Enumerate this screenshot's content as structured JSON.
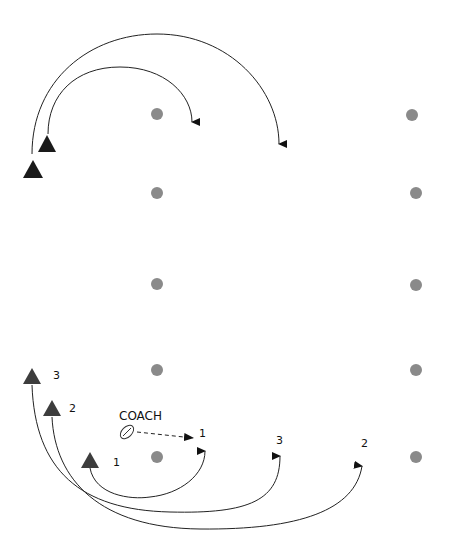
{
  "diagram": {
    "coach_label": "COACH",
    "colors": {
      "cone": "#8a8a8a",
      "player_top": "#1a1a1a",
      "player_bottom": "#3d3d3d",
      "arrow": "#222222"
    },
    "cones_left": [
      {
        "x": 157,
        "y": 114
      },
      {
        "x": 157,
        "y": 193
      },
      {
        "x": 157,
        "y": 284
      },
      {
        "x": 157,
        "y": 370
      },
      {
        "x": 157,
        "y": 457
      }
    ],
    "cones_right": [
      {
        "x": 412,
        "y": 115
      },
      {
        "x": 416,
        "y": 193
      },
      {
        "x": 416,
        "y": 285
      },
      {
        "x": 416,
        "y": 370
      },
      {
        "x": 416,
        "y": 457
      }
    ],
    "players_top": [
      {
        "id": "top-a",
        "x": 47,
        "y": 144
      },
      {
        "id": "top-b",
        "x": 33,
        "y": 170
      }
    ],
    "players_bottom": [
      {
        "id": "3",
        "label": "3",
        "x": 32,
        "y": 376
      },
      {
        "id": "2",
        "label": "2",
        "x": 52,
        "y": 408
      },
      {
        "id": "1",
        "label": "1",
        "x": 90,
        "y": 460
      }
    ],
    "route_targets": [
      {
        "label": "1",
        "x": 205,
        "y": 443
      },
      {
        "label": "3",
        "x": 280,
        "y": 448
      },
      {
        "label": "2",
        "x": 362,
        "y": 458
      }
    ]
  }
}
